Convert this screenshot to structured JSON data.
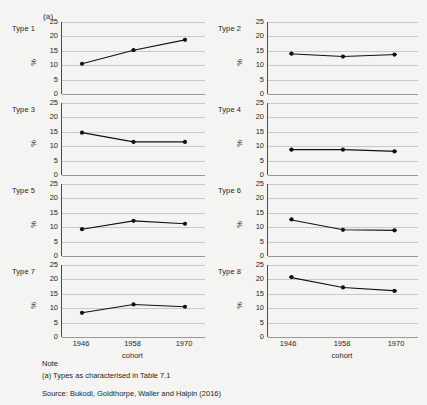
{
  "figure": {
    "note_marker": "(a)",
    "axis": {
      "ylabel": "%",
      "xlabel": "cohort",
      "yticks": [
        "25",
        "20",
        "15",
        "10",
        "5",
        "0"
      ],
      "xticks": [
        "1946",
        "1958",
        "1970"
      ]
    }
  },
  "footer": {
    "note_heading": "Note",
    "note_text": "(a) Types as characterised in Table 7.1",
    "source": "Source: Bukodi, Goldthorpe, Waller and Halpin (2016)"
  },
  "panels": [
    {
      "label": "Type 1",
      "values": [
        10.5,
        15.2,
        18.8
      ]
    },
    {
      "label": "Type 2",
      "values": [
        14.0,
        13.0,
        13.7
      ]
    },
    {
      "label": "Type 3",
      "values": [
        14.7,
        11.5,
        11.5
      ]
    },
    {
      "label": "Type 4",
      "values": [
        8.8,
        8.8,
        8.2
      ]
    },
    {
      "label": "Type 5",
      "values": [
        9.3,
        12.2,
        11.2
      ]
    },
    {
      "label": "Type 6",
      "values": [
        12.7,
        9.1,
        8.9
      ]
    },
    {
      "label": "Type 7",
      "values": [
        8.4,
        11.3,
        10.5
      ]
    },
    {
      "label": "Type 8",
      "values": [
        20.8,
        17.2,
        16.0
      ]
    }
  ],
  "chart_data": {
    "type": "line",
    "title": "",
    "subtitle": "",
    "xlabel": "cohort",
    "ylabel": "%",
    "x": [
      "1946",
      "1958",
      "1970"
    ],
    "categories": [
      "1946",
      "1958",
      "1970"
    ],
    "ylim": [
      0,
      25
    ],
    "yticks": [
      0,
      5,
      10,
      15,
      20,
      25
    ],
    "grid": true,
    "legend": "none",
    "layout": "small-multiples 2 columns x 4 rows",
    "annotations": [
      "(a)",
      "Note",
      "(a) Types as characterised in Table 7.1",
      "Source: Bukodi, Goldthorpe, Waller and Halpin (2016)"
    ],
    "series": [
      {
        "name": "Type 1",
        "values": [
          10.5,
          15.2,
          18.8
        ]
      },
      {
        "name": "Type 2",
        "values": [
          14.0,
          13.0,
          13.7
        ]
      },
      {
        "name": "Type 3",
        "values": [
          14.7,
          11.5,
          11.5
        ]
      },
      {
        "name": "Type 4",
        "values": [
          8.8,
          8.8,
          8.2
        ]
      },
      {
        "name": "Type 5",
        "values": [
          9.3,
          12.2,
          11.2
        ]
      },
      {
        "name": "Type 6",
        "values": [
          12.7,
          9.1,
          8.9
        ]
      },
      {
        "name": "Type 7",
        "values": [
          8.4,
          11.3,
          10.5
        ]
      },
      {
        "name": "Type 8",
        "values": [
          20.8,
          17.2,
          16.0
        ]
      }
    ]
  }
}
